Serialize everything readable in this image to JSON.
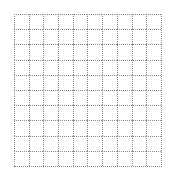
{
  "grid": {
    "rows": 10,
    "columns": 10,
    "line_style": "dotted",
    "line_color": "#8a8a8a",
    "background_color": "#ffffff"
  }
}
